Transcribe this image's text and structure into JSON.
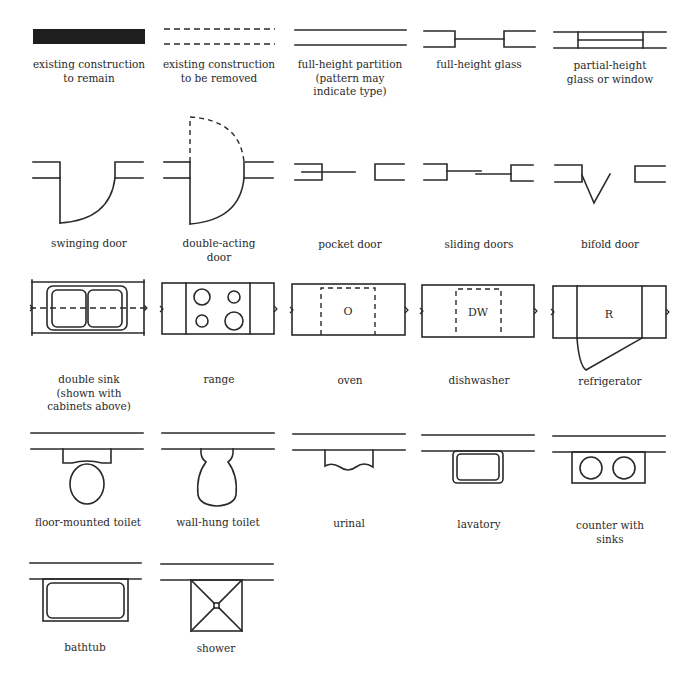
{
  "symbols": [
    {
      "id": "existing-construction-to-remain",
      "label": "existing construction\nto remain"
    },
    {
      "id": "existing-construction-to-be-removed",
      "label": "existing construction\nto be removed"
    },
    {
      "id": "full-height-partition",
      "label": "full-height partition\n(pattern may\nindicate type)"
    },
    {
      "id": "full-height-glass",
      "label": "full-height glass"
    },
    {
      "id": "partial-height-glass-or-window",
      "label": "partial-height\nglass or window"
    },
    {
      "id": "swinging-door",
      "label": "swinging door"
    },
    {
      "id": "double-acting-door",
      "label": "double-acting\ndoor"
    },
    {
      "id": "pocket-door",
      "label": "pocket door"
    },
    {
      "id": "sliding-doors",
      "label": "sliding doors"
    },
    {
      "id": "bifold-door",
      "label": "bifold door"
    },
    {
      "id": "double-sink",
      "label": "double sink\n(shown with\ncabinets above)"
    },
    {
      "id": "range",
      "label": "range"
    },
    {
      "id": "oven",
      "label": "oven",
      "mark": "O"
    },
    {
      "id": "dishwasher",
      "label": "dishwasher",
      "mark": "DW"
    },
    {
      "id": "refrigerator",
      "label": "refrigerator",
      "mark": "R"
    },
    {
      "id": "floor-mounted-toilet",
      "label": "floor-mounted toilet"
    },
    {
      "id": "wall-hung-toilet",
      "label": "wall-hung toilet"
    },
    {
      "id": "urinal",
      "label": "urinal"
    },
    {
      "id": "lavatory",
      "label": "lavatory"
    },
    {
      "id": "counter-with-sinks",
      "label": "counter with\nsinks"
    },
    {
      "id": "bathtub",
      "label": "bathtub"
    },
    {
      "id": "shower",
      "label": "shower"
    }
  ]
}
